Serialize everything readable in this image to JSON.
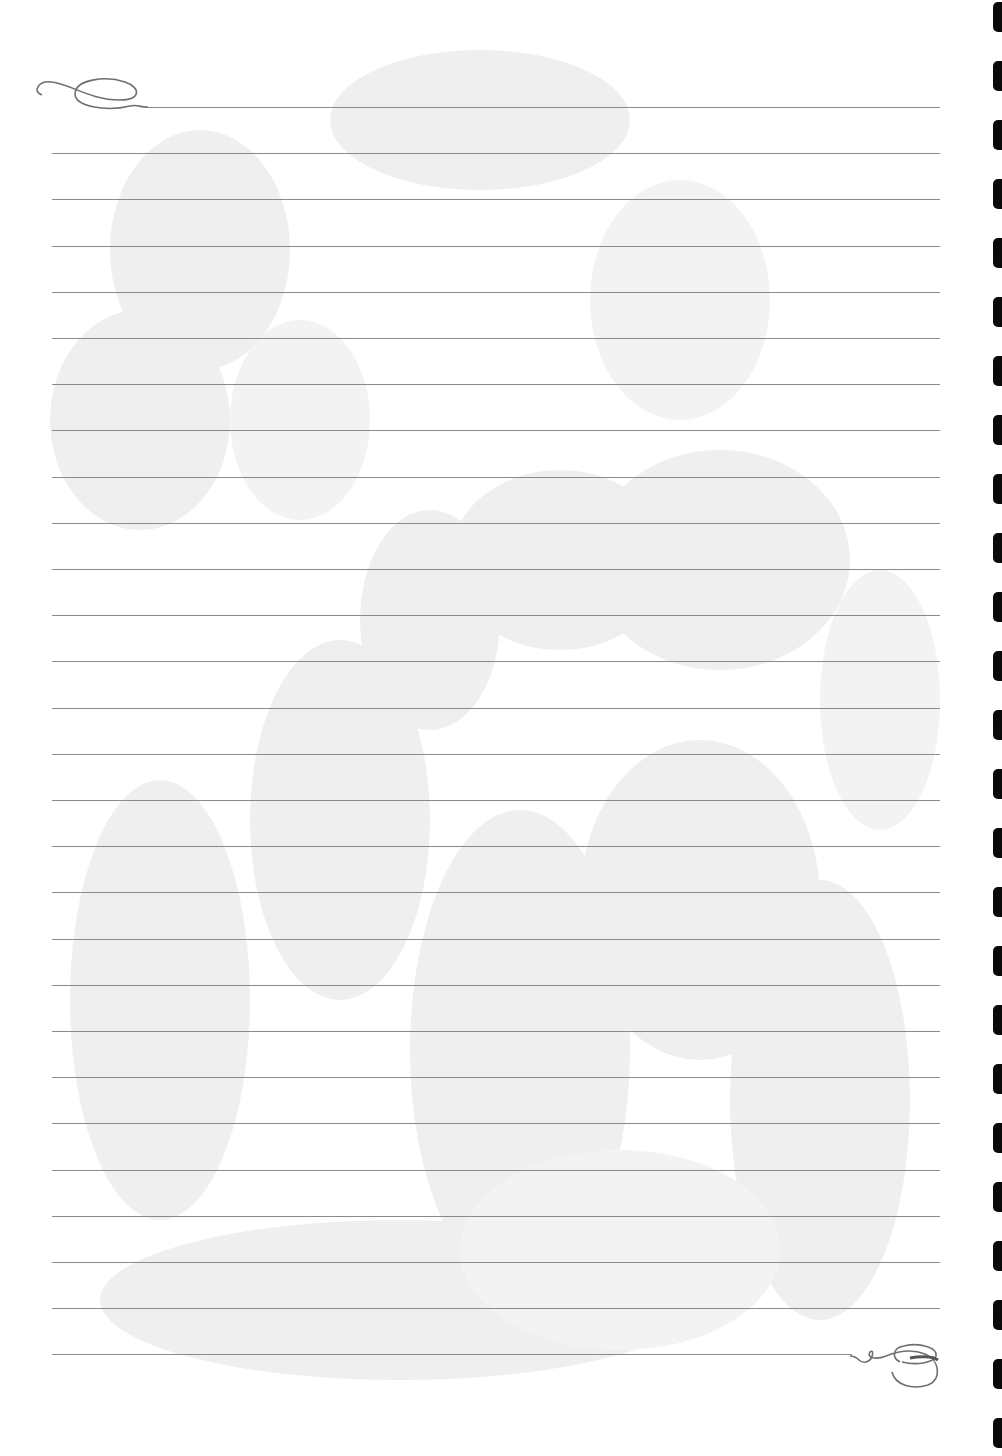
{
  "sheet": {
    "type": "lined-stationery",
    "background_color": "#ffffff",
    "watermark": "faint-floral-tulips",
    "watermark_color": "#ececec",
    "line_color": "#8a8a8a",
    "line_count": 28,
    "first_line_y": 107,
    "line_spacing": 46.2,
    "line_left": 52,
    "line_right": 940,
    "top_flourish": "scroll-flourish-top-left",
    "bottom_flourish": "scroll-flourish-bottom-right",
    "binding_holes": {
      "count": 25,
      "first_y": 2,
      "spacing": 59,
      "color": "#0a0a0a"
    }
  }
}
